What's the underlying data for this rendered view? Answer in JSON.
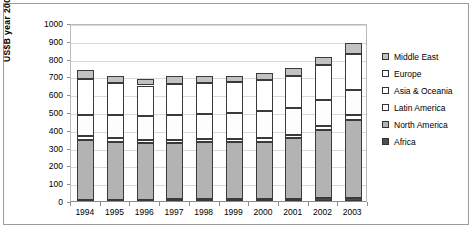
{
  "chart_data": {
    "type": "bar",
    "subtype": "stacked-bar",
    "title": "",
    "xlabel": "",
    "ylabel": "US$B year 2000",
    "ylim": [
      0,
      1000
    ],
    "ytick_step": 100,
    "yticks": [
      "1000",
      "900",
      "800",
      "700",
      "600",
      "500",
      "400",
      "300",
      "200",
      "100",
      "0"
    ],
    "grid": true,
    "legend_position": "right",
    "categories": [
      "1994",
      "1995",
      "1996",
      "1997",
      "1998",
      "1999",
      "2000",
      "2001",
      "2002",
      "2003"
    ],
    "stack_order_bottom_to_top": [
      "Africa",
      "North America",
      "Latin America",
      "Asia & Oceania",
      "Europe",
      "Middle East"
    ],
    "series": [
      {
        "name": "Africa",
        "color": "#4d4d4d",
        "values": [
          8,
          8,
          8,
          14,
          14,
          14,
          14,
          14,
          16,
          16
        ]
      },
      {
        "name": "North America",
        "color": "#b3b3b3",
        "values": [
          337,
          324,
          317,
          310,
          315,
          317,
          320,
          339,
          382,
          440
        ]
      },
      {
        "name": "Latin America",
        "color": "#ffffff",
        "values": [
          22,
          20,
          20,
          18,
          18,
          18,
          20,
          20,
          22,
          25
        ]
      },
      {
        "name": "Asia & Oceania",
        "color": "#fdfdfd",
        "values": [
          118,
          130,
          132,
          140,
          143,
          145,
          150,
          152,
          148,
          145
        ]
      },
      {
        "name": "Europe",
        "color": "#ffffff",
        "values": [
          200,
          180,
          172,
          175,
          175,
          173,
          175,
          180,
          195,
          200
        ]
      },
      {
        "name": "Middle East",
        "color": "#c2c2c2",
        "values": [
          50,
          38,
          36,
          43,
          35,
          33,
          41,
          45,
          47,
          59
        ]
      }
    ],
    "totals": [
      735,
      700,
      685,
      700,
      700,
      700,
      720,
      750,
      810,
      885
    ]
  },
  "legend": {
    "items": [
      {
        "label": "Middle East",
        "swatch": "#c2c2c2"
      },
      {
        "label": "Europe",
        "swatch": "#ffffff"
      },
      {
        "label": "Asia & Oceania",
        "swatch": "#ffffff"
      },
      {
        "label": "Latin America",
        "swatch": "#ffffff"
      },
      {
        "label": "North America",
        "swatch": "#b3b3b3"
      },
      {
        "label": "Africa",
        "swatch": "#4d4d4d"
      }
    ]
  }
}
